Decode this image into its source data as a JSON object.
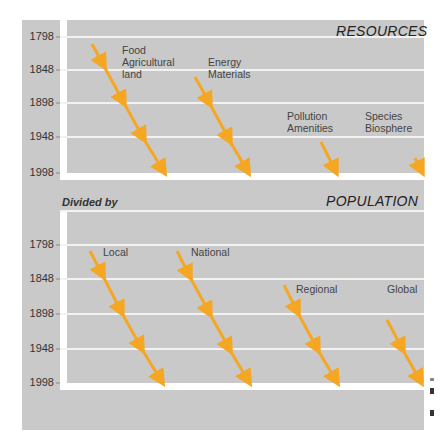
{
  "top_chart": {
    "title": "RESOURCES",
    "y_ticks": [
      "1798",
      "1848",
      "1898",
      "1948",
      "1998"
    ],
    "labels": [
      {
        "id": "food",
        "text": "Food\nAgricultural\nland"
      },
      {
        "id": "energy",
        "text": "Energy\nMaterials"
      },
      {
        "id": "pollution",
        "text": "Pollution\nAmenities"
      },
      {
        "id": "species",
        "text": "Species\nBiosphere"
      }
    ]
  },
  "bottom_chart": {
    "subtitle": "Divided by",
    "title": "POPULATION",
    "y_ticks": [
      "1798",
      "1848",
      "1898",
      "1948",
      "1998"
    ],
    "labels": [
      {
        "id": "local",
        "text": "Local"
      },
      {
        "id": "national",
        "text": "National"
      },
      {
        "id": "regional",
        "text": "Regional"
      },
      {
        "id": "global",
        "text": "Global"
      }
    ]
  },
  "colors": {
    "panel": "#c9c9c9",
    "grid": "#f2f2f2",
    "arrow": "#f5a623",
    "text": "#333333"
  }
}
